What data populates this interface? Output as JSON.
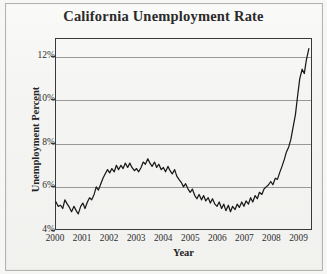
{
  "chart_data": {
    "type": "line",
    "title": "California Unemployment Rate",
    "xlabel": "Year",
    "ylabel": "Unemployment Percent",
    "grid": true,
    "legend": "none",
    "xlim": [
      2000,
      2009.5
    ],
    "ylim": [
      4,
      12.8
    ],
    "ytick_labels": [
      "4%",
      "6%",
      "8%",
      "10%",
      "12%"
    ],
    "ytick_values": [
      4,
      6,
      8,
      10,
      12
    ],
    "xtick_labels": [
      "2000",
      "2001",
      "2002",
      "2003",
      "2004",
      "2005",
      "2006",
      "2007",
      "2008",
      "2009"
    ],
    "xtick_values": [
      2000,
      2001,
      2002,
      2003,
      2004,
      2005,
      2006,
      2007,
      2008,
      2009
    ],
    "line_color": "#1a1a1a",
    "grid_color": "#9a9a9a",
    "axis_color": "#3a3a3a",
    "series": [
      {
        "name": "Unemployment Percent",
        "x": [
          2000.0,
          2000.08,
          2000.17,
          2000.25,
          2000.33,
          2000.42,
          2000.5,
          2000.58,
          2000.67,
          2000.75,
          2000.83,
          2000.92,
          2001.0,
          2001.08,
          2001.17,
          2001.25,
          2001.33,
          2001.42,
          2001.5,
          2001.58,
          2001.67,
          2001.75,
          2001.83,
          2001.92,
          2002.0,
          2002.08,
          2002.17,
          2002.25,
          2002.33,
          2002.42,
          2002.5,
          2002.58,
          2002.67,
          2002.75,
          2002.83,
          2002.92,
          2003.0,
          2003.08,
          2003.17,
          2003.25,
          2003.33,
          2003.42,
          2003.5,
          2003.58,
          2003.67,
          2003.75,
          2003.83,
          2003.92,
          2004.0,
          2004.08,
          2004.17,
          2004.25,
          2004.33,
          2004.42,
          2004.5,
          2004.58,
          2004.67,
          2004.75,
          2004.83,
          2004.92,
          2005.0,
          2005.08,
          2005.17,
          2005.25,
          2005.33,
          2005.42,
          2005.5,
          2005.58,
          2005.67,
          2005.75,
          2005.83,
          2005.92,
          2006.0,
          2006.08,
          2006.17,
          2006.25,
          2006.33,
          2006.42,
          2006.5,
          2006.58,
          2006.67,
          2006.75,
          2006.83,
          2006.92,
          2007.0,
          2007.08,
          2007.17,
          2007.25,
          2007.33,
          2007.42,
          2007.5,
          2007.58,
          2007.67,
          2007.75,
          2007.83,
          2007.92,
          2008.0,
          2008.08,
          2008.17,
          2008.25,
          2008.33,
          2008.42,
          2008.5,
          2008.58,
          2008.67,
          2008.75,
          2008.83,
          2008.92,
          2009.0,
          2009.08,
          2009.17,
          2009.25,
          2009.33,
          2009.42
        ],
        "values": [
          5.25,
          5.05,
          5.1,
          4.95,
          5.35,
          5.15,
          5.0,
          4.8,
          5.05,
          4.85,
          4.7,
          5.05,
          5.2,
          4.95,
          5.25,
          5.45,
          5.35,
          5.6,
          5.95,
          5.8,
          6.1,
          6.35,
          6.55,
          6.75,
          6.6,
          6.8,
          6.65,
          6.95,
          6.75,
          6.95,
          6.8,
          7.05,
          6.85,
          7.05,
          6.85,
          6.7,
          6.8,
          6.65,
          6.85,
          7.1,
          7.0,
          7.25,
          7.05,
          6.9,
          7.1,
          6.85,
          7.0,
          6.75,
          6.85,
          6.65,
          6.9,
          6.7,
          6.55,
          6.75,
          6.45,
          6.3,
          6.15,
          5.95,
          6.1,
          5.85,
          5.7,
          5.85,
          5.55,
          5.4,
          5.6,
          5.35,
          5.55,
          5.3,
          5.45,
          5.2,
          5.4,
          5.15,
          5.05,
          5.25,
          4.95,
          5.15,
          4.85,
          5.1,
          4.8,
          5.05,
          4.9,
          5.15,
          5.0,
          5.25,
          5.05,
          5.3,
          5.15,
          5.45,
          5.25,
          5.55,
          5.4,
          5.7,
          5.6,
          5.85,
          5.95,
          6.05,
          6.2,
          6.05,
          6.35,
          6.3,
          6.6,
          6.9,
          7.2,
          7.55,
          7.8,
          8.15,
          8.7,
          9.3,
          10.15,
          10.95,
          11.4,
          11.2,
          11.85,
          12.35
        ]
      }
    ]
  },
  "chart": {
    "title": "California Unemployment Rate",
    "xlabel": "Year",
    "ylabel": "Unemployment Percent"
  }
}
